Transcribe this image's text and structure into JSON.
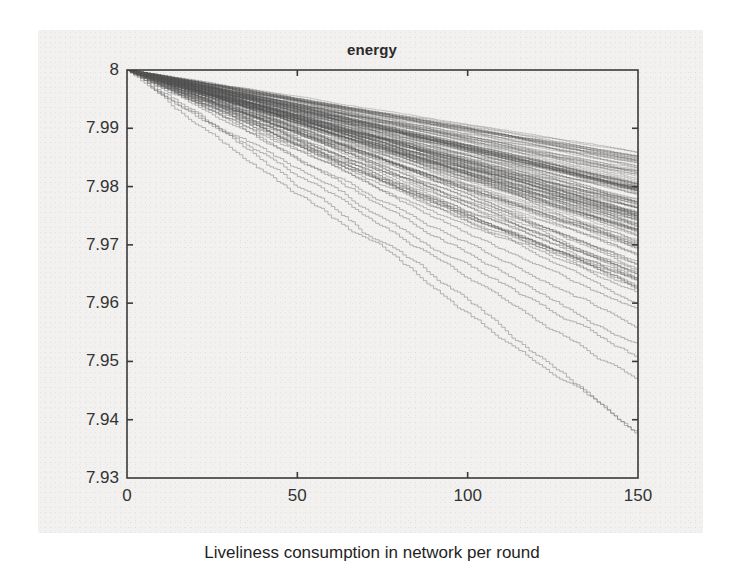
{
  "figure": {
    "caption": "Liveliness consumption in network per round",
    "panel_background": "#f2f1ef",
    "page_background": "#ffffff"
  },
  "chart_data": {
    "type": "line",
    "title": "energy",
    "xlabel": "",
    "ylabel": "",
    "xlim": [
      0,
      150
    ],
    "ylim": [
      7.93,
      8.0
    ],
    "xticks": [
      0,
      50,
      100,
      150
    ],
    "xtick_labels": [
      "0",
      "50",
      "100",
      "150"
    ],
    "yticks": [
      7.93,
      7.94,
      7.95,
      7.96,
      7.97,
      7.98,
      7.99,
      8.0
    ],
    "ytick_labels": [
      "7.93",
      "7.94",
      "7.95",
      "7.96",
      "7.97",
      "7.98",
      "7.99",
      "8"
    ],
    "grid": false,
    "legend": null,
    "axis_box": true,
    "tick_direction": "in",
    "line_color": "#5a5a5a",
    "axis_color": "#3a3a3a",
    "n_series": 160,
    "series_common_x": [
      0,
      150
    ],
    "series_summary": {
      "start_value": 8.0,
      "end_value_band_top": 7.9855,
      "end_value_band_bottom": 7.962,
      "end_value_dense_core_top": 7.984,
      "end_value_dense_core_bottom": 7.967,
      "end_value_min_outlier": 7.9375,
      "end_value_outliers": [
        7.9375,
        7.947,
        7.9505,
        7.9525,
        7.9555,
        7.9585,
        7.9605
      ],
      "step_count_per_series": 150,
      "shape": "staircase-monotonic-decreasing"
    },
    "envelope": {
      "x": [
        0,
        25,
        50,
        75,
        100,
        125,
        150
      ],
      "band_top": [
        8.0,
        7.9977,
        7.9953,
        7.9929,
        7.9906,
        7.9882,
        7.9855
      ],
      "core_top": [
        8.0,
        7.9973,
        7.9946,
        7.9919,
        7.9893,
        7.9866,
        7.984
      ],
      "core_bottom": [
        8.0,
        7.9945,
        7.989,
        7.9835,
        7.978,
        7.9725,
        7.967
      ],
      "band_bottom": [
        8.0,
        7.9937,
        7.9873,
        7.981,
        7.9747,
        7.9683,
        7.962
      ],
      "outlier_min": [
        8.0,
        7.9896,
        7.9792,
        7.9688,
        7.9583,
        7.9479,
        7.9375
      ]
    }
  }
}
